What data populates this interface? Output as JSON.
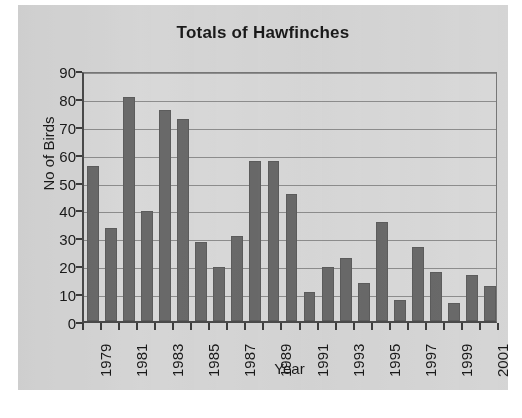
{
  "chart_data": {
    "type": "bar",
    "title": "Totals of Hawfinches",
    "xlabel": "Year",
    "ylabel": "No of Birds",
    "ylim": [
      0,
      90
    ],
    "ytick_step": 10,
    "yticks": [
      90,
      80,
      70,
      60,
      50,
      40,
      30,
      20,
      10,
      0
    ],
    "grid": true,
    "legend": null,
    "categories": [
      "1979",
      "1980",
      "1981",
      "1982",
      "1983",
      "1984",
      "1985",
      "1986",
      "1987",
      "1988",
      "1989",
      "1990",
      "1991",
      "1992",
      "1993",
      "1994",
      "1995",
      "1996",
      "1997",
      "1998",
      "1999",
      "2000",
      "2001"
    ],
    "values": [
      55.5,
      33.5,
      80.5,
      39.5,
      75.5,
      72.5,
      28.5,
      19.5,
      30.5,
      57.5,
      57.5,
      45.5,
      10.5,
      19.5,
      22.5,
      13.5,
      35.5,
      7.5,
      26.5,
      17.5,
      6.5,
      16.5,
      12.5
    ],
    "xtick_labels_shown": [
      "1979",
      "1981",
      "1983",
      "1985",
      "1987",
      "1989",
      "1991",
      "1993",
      "1995",
      "1997",
      "1999",
      "2001"
    ],
    "colors": {
      "bar": "#696969",
      "bar_border": "#5c5c5c",
      "plot_background": "#d8d8d8",
      "card_background": "#d5d5d5",
      "gridline": "#8d8d8d",
      "axis": "#4a4a4a",
      "text": "#1a1a1a",
      "page_background": "#ffffff"
    }
  }
}
